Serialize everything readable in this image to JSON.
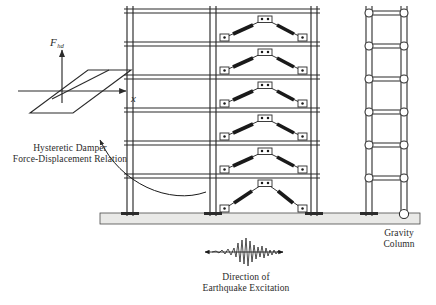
{
  "figure": {
    "background_color": "#ffffff",
    "line_color": "#2b2b2b",
    "slab_color": "#e8e8e6",
    "damper_color": "#1a1a1a"
  },
  "hysteresis": {
    "y_axis_label": "F",
    "y_axis_subscript": "hd",
    "x_axis_label": "x",
    "loop_type": "parallelogram",
    "description": "Elastoplastic hysteretic force-displacement loop"
  },
  "labels": {
    "damper_line1": "Hysteretic Damper",
    "damper_line2": "Force-Displacement Relation",
    "gravity_line1": "Gravity",
    "gravity_line2": "Column",
    "excitation_line1": "Direction of",
    "excitation_line2": "Earthquake Excitation"
  },
  "structure": {
    "stories": 6,
    "moment_frame_bays": 2,
    "gravity_bays": 2,
    "brace_type": "chevron",
    "braces_per_story": 1,
    "base_support_moment_frame": "fixed",
    "base_support_gravity": "pinned",
    "joint_type_gravity": "pinned-circle"
  }
}
